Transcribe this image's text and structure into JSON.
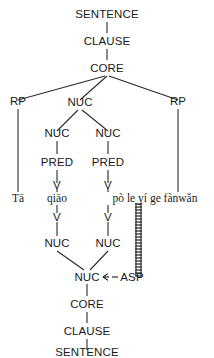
{
  "diagram": {
    "type": "rrg-layered-structure-tree",
    "caption_top_chain": [
      "SENTENCE",
      "CLAUSE",
      "CORE"
    ],
    "caption_bottom_chain": [
      "CORE",
      "CLAUSE",
      "SENTENCE"
    ],
    "colors": {
      "background": "#ffffff",
      "text": "#1a1a1a",
      "line": "#2a2a2a"
    }
  },
  "constituent_nodes": {
    "sentence_top": "SENTENCE",
    "clause_top": "CLAUSE",
    "core_top": "CORE",
    "rp_left": "RP",
    "rp_right": "RP",
    "nuc_top": "NUC",
    "nuc_left": "NUC",
    "nuc_right": "NUC",
    "pred_left": "PRED",
    "pred_right": "PRED",
    "v_left_upper": "V",
    "v_right_upper": "V",
    "v_left_lower": "V",
    "v_right_lower": "V",
    "nuc_left_lower": "NUC",
    "nuc_right_lower": "NUC",
    "nuc_bottom": "NUC",
    "asp": "ASP",
    "core_bottom": "CORE",
    "clause_bottom": "CLAUSE",
    "sentence_bottom": "SENTENCE"
  },
  "lexical_items": {
    "subject": "Tā",
    "verb1": "qiāo",
    "verb_phrase2": "pò le yí ge fànwǎn"
  },
  "operator_projection": {
    "label": "ASP",
    "arrow_glyph": "<--",
    "attaches_to": "NUC"
  }
}
